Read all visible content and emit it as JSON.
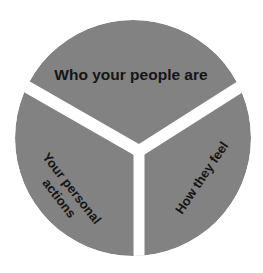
{
  "diagram": {
    "type": "segmented-circle",
    "segments": [
      {
        "id": "top",
        "label": "Who your people are"
      },
      {
        "id": "left",
        "label_line1": "Your personal",
        "label_line2": "actions"
      },
      {
        "id": "right",
        "label": "How they feel"
      }
    ],
    "colors": {
      "segment_fill": "#828282",
      "gap": "#ffffff",
      "text": "#151515"
    }
  }
}
